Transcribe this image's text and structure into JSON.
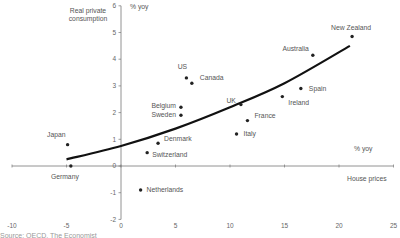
{
  "chart_data": {
    "type": "scatter",
    "title": "",
    "ylabel": "Real private consumption",
    "ylabel_unit": "% yoy",
    "xlabel": "House prices",
    "xlabel_unit": "% yoy",
    "xlim": [
      -10,
      25
    ],
    "ylim": [
      -2,
      6
    ],
    "xticks": [
      -10,
      -5,
      0,
      5,
      10,
      15,
      20,
      25
    ],
    "yticks": [
      -2,
      -1,
      0,
      1,
      2,
      3,
      4,
      5,
      6
    ],
    "grid": false,
    "legend": null,
    "points": [
      {
        "label": "Japan",
        "x": -4.9,
        "y": 0.8
      },
      {
        "label": "Germany",
        "x": -4.6,
        "y": 0.0
      },
      {
        "label": "Netherlands",
        "x": 1.8,
        "y": -0.9
      },
      {
        "label": "Switzerland",
        "x": 2.4,
        "y": 0.5
      },
      {
        "label": "Denmark",
        "x": 3.4,
        "y": 0.85
      },
      {
        "label": "Belgium",
        "x": 5.5,
        "y": 2.2
      },
      {
        "label": "Sweden",
        "x": 5.5,
        "y": 1.9
      },
      {
        "label": "US",
        "x": 6.0,
        "y": 3.3
      },
      {
        "label": "Canada",
        "x": 6.5,
        "y": 3.1
      },
      {
        "label": "Italy",
        "x": 10.6,
        "y": 1.2
      },
      {
        "label": "UK",
        "x": 11.0,
        "y": 2.3
      },
      {
        "label": "France",
        "x": 11.6,
        "y": 1.7
      },
      {
        "label": "Ireland",
        "x": 14.8,
        "y": 2.6
      },
      {
        "label": "Spain",
        "x": 16.5,
        "y": 2.9
      },
      {
        "label": "Australia",
        "x": 17.6,
        "y": 4.15
      },
      {
        "label": "New Zealand",
        "x": 21.2,
        "y": 4.85
      }
    ],
    "trendline": {
      "type": "polynomial",
      "x": [
        -5,
        0,
        5,
        10,
        15,
        21
      ],
      "y": [
        0.25,
        0.75,
        1.4,
        2.2,
        3.1,
        4.5
      ]
    }
  },
  "source_text": "Source: OECD, The Economist"
}
